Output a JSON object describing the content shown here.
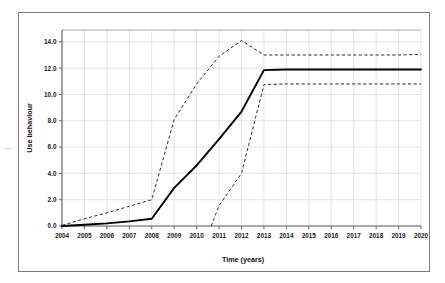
{
  "chart_data": {
    "type": "line",
    "title": "",
    "xlabel": "Time (years)",
    "ylabel": "Use behaviour",
    "xlim": [
      2004,
      2020
    ],
    "ylim": [
      0.0,
      14.9
    ],
    "grid": true,
    "legend": "none",
    "x_tick_labels": [
      "2004",
      "2005",
      "2006",
      "2007",
      "2008",
      "2009",
      "2010",
      "2011",
      "2012",
      "2013",
      "2014",
      "2015",
      "2016",
      "2017",
      "2018",
      "2019",
      "2020"
    ],
    "y_tick_labels": [
      "0.0",
      "2.0",
      "4.0",
      "6.0",
      "8.0",
      "10.0",
      "12.0",
      "14.0"
    ],
    "y_tick_values": [
      0.0,
      2.0,
      4.0,
      6.0,
      8.0,
      10.0,
      12.0,
      14.0
    ],
    "x": [
      2004,
      2005,
      2006,
      2007,
      2008,
      2009,
      2010,
      2011,
      2012,
      2013,
      2014,
      2015,
      2016,
      2017,
      2018,
      2019,
      2020
    ],
    "series": [
      {
        "name": "Expected use behaviour",
        "style": "solid",
        "color": "#000000",
        "values": [
          0.0,
          0.1,
          0.2,
          0.35,
          0.55,
          2.9,
          4.6,
          6.6,
          8.7,
          11.85,
          11.9,
          11.9,
          11.9,
          11.9,
          11.9,
          11.9,
          11.9
        ]
      },
      {
        "name": "Upper bound",
        "style": "dashed",
        "color": "#2b2b2b",
        "values": [
          0.05,
          0.55,
          1.0,
          1.5,
          2.0,
          8.1,
          10.8,
          12.9,
          14.1,
          13.0,
          13.0,
          13.0,
          13.0,
          13.0,
          13.0,
          13.0,
          13.05
        ]
      },
      {
        "name": "Lower bound",
        "style": "dashed",
        "color": "#2b2b2b",
        "x_start": 2010.65,
        "values": [
          null,
          null,
          null,
          null,
          null,
          null,
          0.0,
          1.55,
          4.0,
          10.75,
          10.8,
          10.8,
          10.8,
          10.8,
          10.8,
          10.8,
          10.8
        ]
      }
    ],
    "annotations": []
  }
}
